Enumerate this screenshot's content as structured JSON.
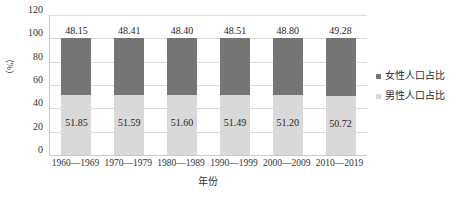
{
  "chart_data": {
    "type": "bar",
    "stacked": true,
    "title": "",
    "subtitle": "",
    "xlabel": "年份",
    "ylabel": "（%）",
    "ylim": [
      0,
      120
    ],
    "yticks": [
      "0",
      "20",
      "40",
      "60",
      "80",
      "100",
      "120"
    ],
    "grid": true,
    "legend_position": "right",
    "categories": [
      "1960—1969",
      "1970—1979",
      "1980—1989",
      "1990—1999",
      "2000—2009",
      "2010—2019"
    ],
    "series": [
      {
        "name": "女性人口占比",
        "color": "#757575",
        "values": [
          48.15,
          48.41,
          48.4,
          48.51,
          48.8,
          49.28
        ],
        "labels": [
          "48.15",
          "48.41",
          "48.40",
          "48.51",
          "48.80",
          "49.28"
        ]
      },
      {
        "name": "男性人口占比",
        "color": "#d9d9d9",
        "values": [
          51.85,
          51.59,
          51.6,
          51.49,
          51.2,
          50.72
        ],
        "labels": [
          "51.85",
          "51.59",
          "51.60",
          "51.49",
          "51.20",
          "50.72"
        ]
      }
    ]
  },
  "colors": {
    "female": "#757575",
    "male": "#d9d9d9",
    "gridline": "#dcdcdc",
    "axis": "#c8c8c8",
    "text": "#2b2b2b"
  },
  "legend": {
    "items": [
      {
        "label": "女性人口占比",
        "color": "#757575"
      },
      {
        "label": "男性人口占比",
        "color": "#d9d9d9"
      }
    ]
  },
  "axes": {
    "y_title": "（%）",
    "x_title": "年份"
  }
}
